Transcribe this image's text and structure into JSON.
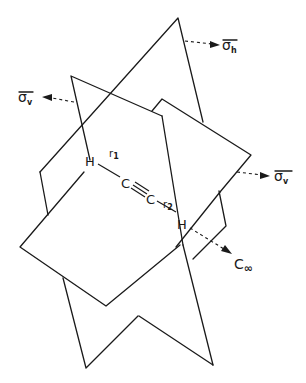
{
  "figure": {
    "atoms": [
      {
        "id": "H1",
        "label": "H"
      },
      {
        "id": "C1",
        "label": "C"
      },
      {
        "id": "C2",
        "label": "C"
      },
      {
        "id": "H2",
        "label": "H"
      }
    ],
    "bond_labels": {
      "r1": {
        "base": "r",
        "sub": "1"
      },
      "r2": {
        "base": "r",
        "sub": "2"
      }
    },
    "symmetry_labels": {
      "sigma_h": {
        "base": "σ",
        "sub": "h"
      },
      "sigma_v_left": {
        "base": "σ",
        "sub": "v"
      },
      "sigma_v_right": {
        "base": "σ",
        "sub": "v"
      },
      "c_inf": {
        "base": "C",
        "sub": "∞"
      }
    },
    "colors": {
      "line": "#1a1a1a",
      "background": "#ffffff"
    }
  }
}
